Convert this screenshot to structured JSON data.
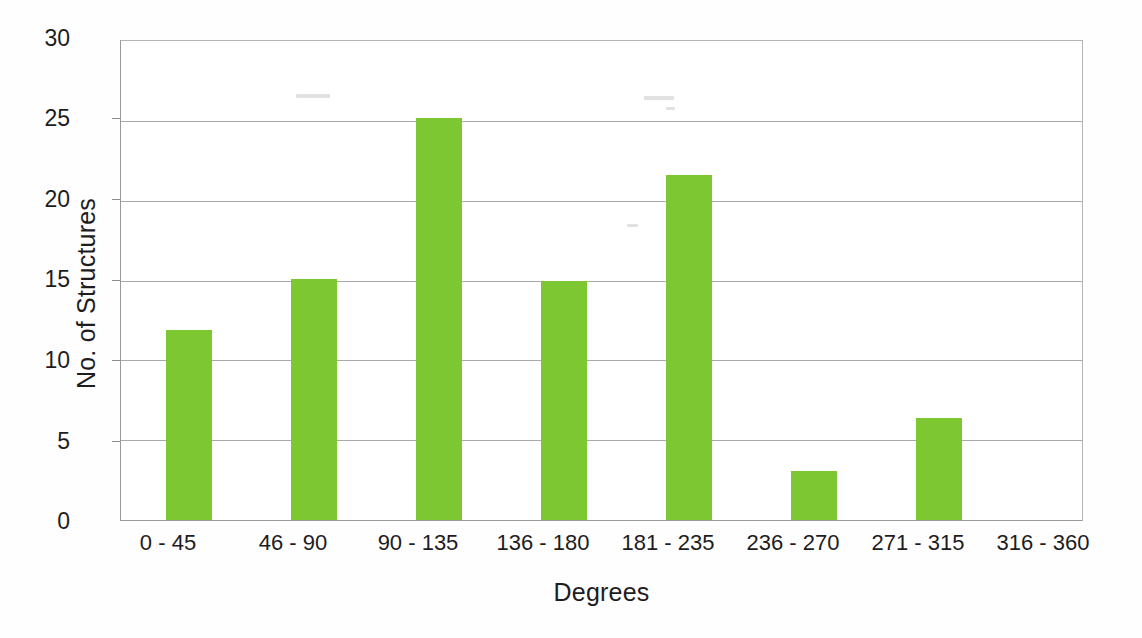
{
  "chart_data": {
    "type": "bar",
    "title": "",
    "subtitle": "",
    "xlabel": "Degrees",
    "ylabel": "No. of Structures",
    "categories": [
      "0 - 45",
      "46 - 90",
      "90 - 135",
      "136 - 180",
      "181 - 235",
      "236 - 270",
      "271 - 315",
      "316 - 360"
    ],
    "values": [
      11.9,
      15.1,
      25.2,
      15.0,
      21.6,
      3.1,
      6.4,
      0
    ],
    "series": [
      {
        "name": "No. of Structures",
        "values": [
          11.9,
          15.1,
          25.2,
          15.0,
          21.6,
          3.1,
          6.4,
          0
        ]
      }
    ],
    "ylim": [
      0,
      30
    ],
    "yticks": [
      0,
      5,
      10,
      15,
      20,
      25,
      30
    ],
    "ytick_labels": [
      "0",
      "5",
      "10",
      "15",
      "20",
      "25",
      "30"
    ],
    "grid": "horizontal",
    "legend": "none",
    "bar_color": "#7dc832",
    "axis_color": "#9a9a9a",
    "gridline_color": "#a9a9a9",
    "text_color": "#1e1c1d",
    "background": "#ffffff"
  }
}
